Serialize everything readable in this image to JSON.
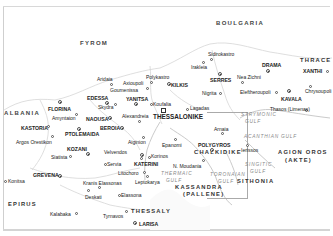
{
  "map": {
    "title": "Macedonia (Northern Greece) regional map",
    "countries": [
      {
        "name": "FYROM",
        "x": 80,
        "y": 43
      },
      {
        "name": "BOULGARIA",
        "x": 216,
        "y": 23
      },
      {
        "name": "ALBANIA",
        "x": 4,
        "y": 111
      }
    ],
    "regions": [
      {
        "name": "THRACE",
        "x": 300,
        "y": 60
      },
      {
        "name": "EPIRUS",
        "x": 8,
        "y": 203
      },
      {
        "name": "THESSALY",
        "x": 131,
        "y": 210
      },
      {
        "name": "CHALKIDIKE",
        "x": 194,
        "y": 151
      },
      {
        "name": "KASSANDRA",
        "x": 175,
        "y": 186
      },
      {
        "name": "(PALLENE)",
        "x": 183,
        "y": 193
      },
      {
        "name": "SITHONIA",
        "x": 237,
        "y": 180
      },
      {
        "name": "AGION OROS",
        "x": 278,
        "y": 151
      },
      {
        "name": "(AKTE)",
        "x": 285,
        "y": 159
      }
    ],
    "gulfs": [
      {
        "name": "STRYMONIC",
        "x": 241,
        "y": 114
      },
      {
        "name": "GULF",
        "x": 245,
        "y": 121
      },
      {
        "name": "ACANTHIAN GULF",
        "x": 244,
        "y": 135
      },
      {
        "name": "SINGITIC",
        "x": 245,
        "y": 164
      },
      {
        "name": "GULF",
        "x": 250,
        "y": 171
      },
      {
        "name": "THERMAIC",
        "x": 161,
        "y": 172
      },
      {
        "name": "GULF",
        "x": 166,
        "y": 179
      },
      {
        "name": "TORONAIAN",
        "x": 210,
        "y": 173
      },
      {
        "name": "GULF",
        "x": 218,
        "y": 180
      }
    ],
    "cities": [
      {
        "name": "THESSALONIKE",
        "x": 153,
        "y": 116,
        "type": "major",
        "dot": [
          163,
          110
        ]
      },
      {
        "name": "Sidirokastro",
        "x": 208,
        "y": 53,
        "type": "town",
        "dot": [
          211,
          59
        ]
      },
      {
        "name": "Irakleia",
        "x": 191,
        "y": 64,
        "type": "town",
        "dot": [
          203,
          62
        ]
      },
      {
        "name": "SERRES",
        "x": 210,
        "y": 79,
        "type": "capital",
        "dot": [
          220,
          73
        ]
      },
      {
        "name": "DRAMA",
        "x": 262,
        "y": 64,
        "type": "capital",
        "dot": [
          268,
          70
        ]
      },
      {
        "name": "Nea Zichni",
        "x": 237,
        "y": 76,
        "type": "town",
        "dot": [
          242,
          82
        ]
      },
      {
        "name": "XANTHI",
        "x": 303,
        "y": 70,
        "type": "capital",
        "dot": [
          326,
          72
        ]
      },
      {
        "name": "Nigrita",
        "x": 202,
        "y": 91,
        "type": "town",
        "dot": [
          220,
          93
        ]
      },
      {
        "name": "Eleftheroupoli",
        "x": 240,
        "y": 91,
        "type": "town",
        "dot": [
          277,
          92
        ]
      },
      {
        "name": "KAVALA",
        "x": 281,
        "y": 97,
        "type": "capital",
        "dot": [
          289,
          91
        ]
      },
      {
        "name": "Chrysoupoli",
        "x": 305,
        "y": 89,
        "type": "town",
        "dot": [
          310,
          86
        ]
      },
      {
        "name": "Thasos (Limenas)",
        "x": 270,
        "y": 107,
        "type": "town",
        "dot": [
          306,
          110
        ]
      },
      {
        "name": "KILKIS",
        "x": 171,
        "y": 83,
        "type": "capital",
        "dot": [
          169,
          84
        ]
      },
      {
        "name": "Polykastro",
        "x": 146,
        "y": 75,
        "type": "town",
        "dot": [
          151,
          82
        ]
      },
      {
        "name": "Axioupoli",
        "x": 125,
        "y": 81,
        "type": "town",
        "dot": [
          147,
          83
        ]
      },
      {
        "name": "Goumenissa",
        "x": 111,
        "y": 88,
        "type": "town",
        "dot": [
          145,
          88
        ]
      },
      {
        "name": "Aridaia",
        "x": 97,
        "y": 77,
        "type": "town",
        "dot": [
          111,
          84
        ]
      },
      {
        "name": "Lagadas",
        "x": 186,
        "y": 107,
        "type": "town",
        "dot": [
          187,
          109
        ]
      },
      {
        "name": "Koufalia",
        "x": 153,
        "y": 102,
        "type": "town",
        "dot": [
          151,
          104
        ]
      },
      {
        "name": "YANITSA",
        "x": 126,
        "y": 97,
        "type": "capital",
        "dot": [
          136,
          104
        ]
      },
      {
        "name": "EDESSA",
        "x": 87,
        "y": 96,
        "type": "capital",
        "dot": [
          107,
          103
        ]
      },
      {
        "name": "Skydra",
        "x": 98,
        "y": 106,
        "type": "town",
        "dot": [
          115,
          104
        ]
      },
      {
        "name": "Alexandreia",
        "x": 122,
        "y": 115,
        "type": "town",
        "dot": [
          139,
          121
        ]
      },
      {
        "name": "FLORINA",
        "x": 48,
        "y": 107,
        "type": "capital",
        "dot": [
          60,
          102
        ]
      },
      {
        "name": "Amyntaion",
        "x": 52,
        "y": 116,
        "type": "town",
        "dot": [
          76,
          114
        ]
      },
      {
        "name": "NAOUSA",
        "x": 86,
        "y": 117,
        "type": "capital",
        "dot": [
          109,
          118
        ]
      },
      {
        "name": "KASTORIA",
        "x": 21,
        "y": 126,
        "type": "capital",
        "dot": [
          48,
          126
        ]
      },
      {
        "name": "BEROIA",
        "x": 100,
        "y": 126,
        "type": "capital",
        "dot": [
          121,
          128
        ]
      },
      {
        "name": "PTOLEMAIDA",
        "x": 65,
        "y": 132,
        "type": "capital",
        "dot": [
          79,
          129
        ]
      },
      {
        "name": "Argos Orestikon",
        "x": 16,
        "y": 140,
        "type": "town",
        "dot": [
          52,
          136
        ]
      },
      {
        "name": "Aiginion",
        "x": 128,
        "y": 141,
        "type": "town",
        "dot": [
          143,
          137
        ]
      },
      {
        "name": "Epanomi",
        "x": 162,
        "y": 143,
        "type": "town",
        "dot": [
          175,
          139
        ]
      },
      {
        "name": "POLYGYROS",
        "x": 198,
        "y": 143,
        "type": "capital",
        "dot": [
          212,
          149
        ]
      },
      {
        "name": "Arnaia",
        "x": 214,
        "y": 127,
        "type": "town",
        "dot": [
          222,
          133
        ]
      },
      {
        "name": "Ierissos",
        "x": 241,
        "y": 148,
        "type": "town",
        "dot": [
          247,
          145
        ]
      },
      {
        "name": "KOZANI",
        "x": 67,
        "y": 147,
        "type": "capital",
        "dot": [
          88,
          153
        ]
      },
      {
        "name": "Siatista",
        "x": 51,
        "y": 155,
        "type": "town",
        "dot": [
          70,
          156
        ]
      },
      {
        "name": "Velvendos",
        "x": 104,
        "y": 150,
        "type": "town",
        "dot": [
          141,
          158
        ]
      },
      {
        "name": "Korinos",
        "x": 150,
        "y": 154,
        "type": "town",
        "dot": [
          149,
          157
        ]
      },
      {
        "name": "KATERINI",
        "x": 134,
        "y": 162,
        "type": "capital",
        "dot": [
          142,
          155
        ]
      },
      {
        "name": "Servia",
        "x": 104,
        "y": 162,
        "type": "town",
        "dot": [
          105,
          164
        ]
      },
      {
        "name": "N. Moudania",
        "x": 173,
        "y": 164,
        "type": "town",
        "dot": [
          203,
          160
        ]
      },
      {
        "name": "Konitsa",
        "x": 4,
        "y": 179,
        "type": "town",
        "dot": [
          5,
          181
        ]
      },
      {
        "name": "GREVENA",
        "x": 33,
        "y": 173,
        "type": "capital",
        "dot": [
          60,
          175
        ]
      },
      {
        "name": "Litochoro",
        "x": 118,
        "y": 171,
        "type": "town",
        "dot": [
          144,
          172
        ]
      },
      {
        "name": "Leptokarya",
        "x": 135,
        "y": 180,
        "type": "town",
        "dot": [
          147,
          176
        ]
      },
      {
        "name": "Kranis Elassonas",
        "x": 83,
        "y": 181,
        "type": "town",
        "dot": [
          99,
          187
        ]
      },
      {
        "name": "Deskati",
        "x": 85,
        "y": 195,
        "type": "town",
        "dot": [
          88,
          190
        ]
      },
      {
        "name": "Elassona",
        "x": 120,
        "y": 193,
        "type": "town",
        "dot": [
          119,
          195
        ]
      },
      {
        "name": "Kalabaka",
        "x": 50,
        "y": 212,
        "type": "town",
        "dot": [
          76,
          213
        ]
      },
      {
        "name": "Tyrnavos",
        "x": 103,
        "y": 214,
        "type": "town",
        "dot": [
          126,
          211
        ]
      },
      {
        "name": "LARISA",
        "x": 139,
        "y": 222,
        "type": "capital",
        "dot": [
          135,
          222
        ]
      }
    ]
  }
}
